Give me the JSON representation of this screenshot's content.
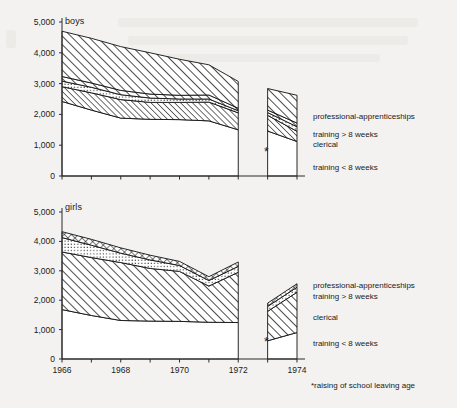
{
  "figure": {
    "background": "#f3f2f0",
    "ink": "#111111"
  },
  "footnote": {
    "text": "*raising of school leaving age",
    "marker": "*"
  },
  "axis": {
    "y_ticks": [
      "5,000",
      "4,000",
      "3,000",
      "2,000",
      "1,000",
      "0"
    ],
    "y_values": [
      5000,
      4000,
      3000,
      2000,
      1000,
      0
    ],
    "x_ticks": [
      "1966",
      "1968",
      "1970",
      "1972",
      "1974"
    ],
    "x_tick_values": [
      1966,
      1968,
      1970,
      1972,
      1974
    ],
    "x_minor_years": [
      1966,
      1967,
      1968,
      1969,
      1970,
      1971,
      1972,
      1973,
      1974
    ]
  },
  "panels": [
    {
      "id": "boys",
      "title": "boys",
      "star_marker": "*"
    },
    {
      "id": "girls",
      "title": "girls",
      "star_marker": "*"
    }
  ],
  "legend_boys": [
    {
      "label": "professional-apprenticeships",
      "pattern": "diagonal-hatch"
    },
    {
      "label": "training > 8 weeks",
      "pattern": "dotted"
    },
    {
      "label": "clerical",
      "pattern": "diagonal-hatch-fine"
    },
    {
      "label": "training < 8 weeks",
      "pattern": "blank"
    }
  ],
  "legend_girls": [
    {
      "label": "professional-apprenticeships",
      "pattern": "cross-hatch"
    },
    {
      "label": "training > 8 weeks",
      "pattern": "dotted"
    },
    {
      "label": "clerical",
      "pattern": "diagonal-hatch"
    },
    {
      "label": "training < 8 weeks",
      "pattern": "blank"
    }
  ],
  "chart_data": {
    "type": "area",
    "xlabel": "",
    "ylabel": "",
    "xlim": [
      1966,
      1974
    ],
    "ylim": [
      0,
      5000
    ],
    "grid": false,
    "legend_position": "right",
    "annotations": [
      {
        "text": "*raising of school leaving age",
        "note": "footnote for 1973 break"
      },
      {
        "text": "*",
        "panel": "boys",
        "x": 1973,
        "y": 1250
      },
      {
        "text": "*",
        "panel": "girls",
        "x": 1973,
        "y": 700
      }
    ],
    "x": [
      1966,
      1967,
      1968,
      1969,
      1970,
      1971,
      1972,
      1973,
      1974
    ],
    "break_at": 1973,
    "panels": [
      {
        "name": "boys",
        "stacked_boundaries_note": "cumulative upper edges of stacked bands, bottom-up",
        "series": [
          {
            "name": "training < 8 weeks",
            "pattern": "blank",
            "values": [
              2420,
              2140,
              1880,
              1840,
              1830,
              1790,
              1500,
              1460,
              1120
            ]
          },
          {
            "name": "clerical",
            "pattern": "diagonal-hatch-fine",
            "values": [
              2900,
              2700,
              2480,
              2390,
              2390,
              2400,
              2050,
              1970,
              1450
            ]
          },
          {
            "name": "training > 8 weeks",
            "pattern": "dotted",
            "values": [
              3080,
              2880,
              2640,
              2530,
              2500,
              2500,
              2120,
              2060,
              1600
            ]
          },
          {
            "name": "professional-apprenticeships",
            "pattern": "diagonal-hatch",
            "values": [
              3230,
              3020,
              2780,
              2660,
              2620,
              2630,
              2200,
              2140,
              1720
            ]
          }
        ],
        "top_edge": [
          4700,
          4470,
          4200,
          4000,
          3790,
          3610,
          3070,
          2840,
          2620
        ],
        "top_edge_name": "total leavers"
      },
      {
        "name": "girls",
        "stacked_boundaries_note": "cumulative upper edges of stacked bands, bottom-up",
        "series": [
          {
            "name": "training < 8 weeks",
            "pattern": "blank",
            "values": [
              1680,
              1480,
              1310,
              1290,
              1280,
              1250,
              1240,
              620,
              900
            ]
          },
          {
            "name": "clerical",
            "pattern": "diagonal-hatch",
            "values": [
              3640,
              3450,
              3280,
              3080,
              2980,
              2480,
              2950,
              1620,
              2270
            ]
          },
          {
            "name": "training > 8 weeks",
            "pattern": "dotted",
            "values": [
              4130,
              3870,
              3600,
              3370,
              3180,
              2670,
              3150,
              1790,
              2440
            ]
          },
          {
            "name": "professional-apprenticeships",
            "pattern": "cross-hatch",
            "values": [
              4330,
              4070,
              3780,
              3530,
              3320,
              2800,
              3300,
              1900,
              2560
            ]
          }
        ],
        "top_edge": [
          4330,
          4070,
          3780,
          3530,
          3320,
          2800,
          3300,
          1900,
          2560
        ],
        "top_edge_name": "total leavers"
      }
    ]
  }
}
